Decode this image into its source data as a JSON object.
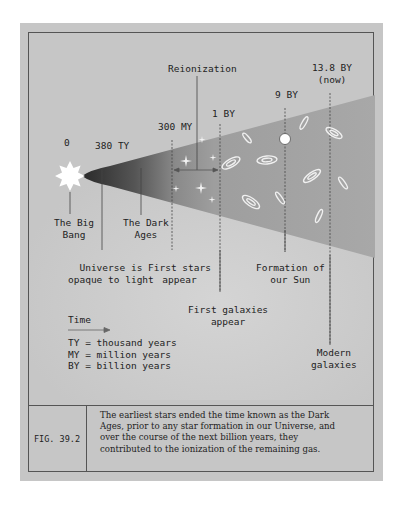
{
  "figure": {
    "id": "FIG. 39.2",
    "caption": "The earliest stars ended the time known as the Dark Ages, prior to any star formation in our Universe, and over the course of the next billion years, they contributed to the ionization of the remaining gas."
  },
  "timeline": {
    "ticks": [
      {
        "label": "0"
      },
      {
        "label": "380 TY"
      },
      {
        "label": "300 MY"
      },
      {
        "label": "1 BY"
      },
      {
        "label": "9 BY"
      },
      {
        "label": "13.8 BY",
        "sublabel": "(now)"
      }
    ],
    "reionization_label": "Reionization"
  },
  "events": {
    "big_bang": {
      "line1": "The Big",
      "line2": "Bang"
    },
    "dark_ages": {
      "line1": "The Dark",
      "line2": "Ages"
    },
    "opaque": {
      "line1": "Universe is",
      "line2": "opaque to light"
    },
    "first_stars": {
      "line1": "First stars",
      "line2": "appear"
    },
    "first_galaxies": {
      "line1": "First galaxies",
      "line2": "appear"
    },
    "sun": {
      "line1": "Formation of",
      "line2": "our Sun"
    },
    "modern": {
      "line1": "Modern",
      "line2": "galaxies"
    }
  },
  "legend": {
    "title": "Time",
    "items": [
      "TY = thousand years",
      "MY = million years",
      "BY = billion years"
    ]
  },
  "colors": {
    "panel": "#c6c6c6",
    "cone_dark": "#3a3a3a",
    "cone_light": "#9a9a9a",
    "line": "#444444"
  }
}
